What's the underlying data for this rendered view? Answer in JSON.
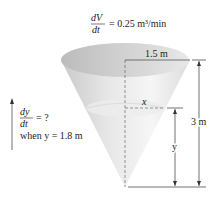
{
  "rate_given": {
    "numerator": "dV",
    "denominator": "dt",
    "value": "= 0.25 m³/min"
  },
  "question": {
    "numerator": "dy",
    "denominator": "dt",
    "value": "= ?",
    "condition": "when y = 1.8 m"
  },
  "labels": {
    "radius": "1.5 m",
    "height": "3 m",
    "water_radius": "x",
    "water_height": "y"
  },
  "colors": {
    "cone_light": "#f2f2f2",
    "cone_dark": "#bdbdbd",
    "water_top": "#e4e4e4",
    "line": "#333333"
  }
}
